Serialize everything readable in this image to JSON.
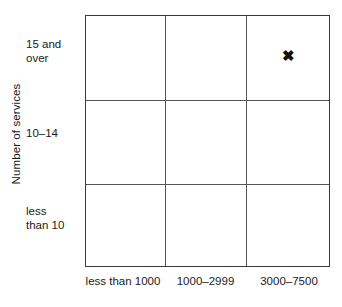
{
  "chart_data": {
    "type": "scatter",
    "title": "",
    "xlabel": "",
    "ylabel": "Number of services",
    "grid": true,
    "legend": null,
    "categories": [
      "less than 1000",
      "1000–2999",
      "3000–7500"
    ],
    "y_categories": [
      "less than 10",
      "10–14",
      "15 and over"
    ],
    "y_categories_top_to_bottom": [
      "15 and over",
      "10–14",
      "less than 10"
    ],
    "marker_glyph": "✖",
    "marker_color": "#111111",
    "points": [
      {
        "x": "3000–7500",
        "y": "15 and over",
        "label": "✖"
      }
    ]
  },
  "axis": {
    "y_title": "Number of services",
    "y_labels": [
      {
        "lines": [
          "15 and",
          "over"
        ]
      },
      {
        "lines": [
          "10–14"
        ]
      },
      {
        "lines": [
          "less",
          "than 10"
        ]
      }
    ],
    "x_labels": [
      "less than 1000",
      "1000–2999",
      "3000–7500"
    ]
  },
  "marker": {
    "glyph": "✖"
  }
}
